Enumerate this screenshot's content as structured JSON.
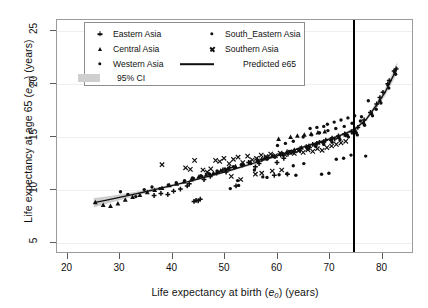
{
  "figure": {
    "background": "#ffffff",
    "panel_border": "#9b9b9b",
    "grid_color": "#efefef"
  },
  "axes": {
    "x": {
      "title_plain": "Life expectancy at birth (e0) (years)",
      "title_prefix": "Life expectancy at birth (",
      "title_var": "e",
      "title_sub": "0",
      "title_suffix": ") (years)",
      "ticks": [
        20,
        30,
        40,
        50,
        60,
        70,
        80
      ],
      "min": 18.0,
      "max": 86.0
    },
    "y": {
      "title_plain": "Life expectancy at age 65 (e65) (years)",
      "title_prefix": "Life expectancy at age 65 (",
      "title_var": "e",
      "title_sub": "65",
      "title_suffix": ") (years)",
      "ticks": [
        5,
        10,
        15,
        20,
        25
      ],
      "min": 4.0,
      "max": 26.0
    }
  },
  "legend": {
    "position": "top-left-inside",
    "border": "#8d8d8d",
    "ci_swatch_color": "#cfcfcf",
    "entries": [
      {
        "label": "Eastern Asia",
        "marker": "plus",
        "col": 0,
        "row": 0
      },
      {
        "label": "Central Asia",
        "marker": "triangle",
        "col": 0,
        "row": 1
      },
      {
        "label": "Western Asia",
        "marker": "dot",
        "col": 0,
        "row": 2
      },
      {
        "label": "95% CI",
        "marker": "band",
        "col": 0,
        "row": 3
      },
      {
        "label": "South_Eastern Asia",
        "marker": "dot",
        "col": 1,
        "row": 0
      },
      {
        "label": "Southern Asia",
        "marker": "x",
        "col": 1,
        "row": 1
      },
      {
        "label": "Predicted e65",
        "marker": "line",
        "col": 1,
        "row": 2
      }
    ]
  },
  "annotations": {
    "vertical_reference_line": {
      "x": 74.5,
      "color": "#000000",
      "width_px": 2
    }
  },
  "chart_data": {
    "type": "scatter",
    "title": "",
    "xlabel": "Life expectancy at birth (e0) (years)",
    "ylabel": "Life expectancy at age 65 (e65) (years)",
    "xlim": [
      18,
      86
    ],
    "ylim": [
      4,
      26
    ],
    "xticks": [
      20,
      30,
      40,
      50,
      60,
      70,
      80
    ],
    "yticks": [
      5,
      10,
      15,
      20,
      25
    ],
    "grid": "horizontal-faint",
    "legend_position": "upper-left-inside",
    "marker_color": "#0f0f0f",
    "fit_line": {
      "name": "Predicted e65",
      "color": "#111111",
      "x": [
        25,
        27,
        29,
        31,
        33,
        35,
        37,
        39,
        41,
        43,
        45,
        47,
        49,
        51,
        53,
        55,
        57,
        59,
        61,
        63,
        65,
        67,
        69,
        71,
        73,
        75,
        77,
        79,
        80.5,
        82,
        82.8
      ],
      "y": [
        8.82,
        9.02,
        9.23,
        9.44,
        9.66,
        9.88,
        10.1,
        10.33,
        10.57,
        10.81,
        11.06,
        11.32,
        11.59,
        11.87,
        12.16,
        12.46,
        12.77,
        13.09,
        13.42,
        13.75,
        14.07,
        14.38,
        14.68,
        14.99,
        15.35,
        15.85,
        16.72,
        18.1,
        19.2,
        20.7,
        21.55
      ]
    },
    "ci_band": {
      "name": "95% CI",
      "color": "#cfcfcf",
      "x": [
        25,
        27,
        29,
        31,
        33,
        35,
        37,
        39,
        41,
        43,
        45,
        47,
        49,
        51,
        53,
        55,
        57,
        59,
        61,
        63,
        65,
        67,
        69,
        71,
        73,
        75,
        77,
        79,
        80.5,
        82,
        82.8
      ],
      "lower": [
        8.38,
        8.66,
        8.94,
        9.2,
        9.46,
        9.71,
        9.96,
        10.2,
        10.45,
        10.7,
        10.95,
        11.21,
        11.48,
        11.76,
        12.05,
        12.35,
        12.66,
        12.98,
        13.31,
        13.64,
        13.96,
        14.27,
        14.57,
        14.87,
        15.22,
        15.7,
        16.52,
        17.82,
        18.85,
        20.25,
        21.05
      ],
      "upper": [
        9.26,
        9.38,
        9.52,
        9.68,
        9.86,
        10.05,
        10.24,
        10.46,
        10.69,
        10.92,
        11.17,
        11.43,
        11.7,
        11.98,
        12.27,
        12.57,
        12.88,
        13.2,
        13.53,
        13.86,
        14.18,
        14.49,
        14.79,
        15.11,
        15.48,
        16.0,
        16.92,
        18.38,
        19.55,
        21.15,
        22.05
      ]
    },
    "series": [
      {
        "name": "Eastern Asia",
        "marker": "plus",
        "points": [
          [
            39.1,
            9.6
          ],
          [
            40.2,
            9.9
          ],
          [
            41.5,
            10.1
          ],
          [
            42.8,
            10.4
          ],
          [
            44.1,
            8.95
          ],
          [
            44.5,
            9.05
          ],
          [
            44.9,
            9.0
          ],
          [
            45.3,
            9.15
          ],
          [
            46.0,
            11.0
          ],
          [
            47.2,
            11.3
          ],
          [
            48.4,
            11.6
          ],
          [
            49.6,
            11.9
          ],
          [
            50.9,
            12.1
          ],
          [
            52.1,
            10.4
          ],
          [
            53.3,
            12.4
          ],
          [
            54.5,
            12.6
          ],
          [
            55.8,
            12.2
          ],
          [
            57.0,
            12.9
          ],
          [
            58.2,
            13.1
          ],
          [
            59.4,
            11.4
          ],
          [
            60.6,
            13.3
          ],
          [
            61.9,
            11.5
          ],
          [
            63.1,
            13.6
          ],
          [
            64.3,
            13.9
          ],
          [
            65.5,
            14.1
          ],
          [
            66.7,
            14.3
          ],
          [
            68.0,
            14.5
          ],
          [
            69.2,
            14.7
          ],
          [
            70.4,
            14.9
          ],
          [
            71.6,
            15.1
          ],
          [
            72.8,
            15.3
          ],
          [
            74.1,
            15.5
          ],
          [
            75.3,
            15.9
          ],
          [
            76.5,
            16.6
          ],
          [
            77.7,
            17.3
          ],
          [
            78.9,
            18.1
          ],
          [
            80.1,
            19.2
          ],
          [
            81.3,
            20.3
          ],
          [
            82.2,
            21.2
          ],
          [
            36.5,
            9.5
          ],
          [
            37.8,
            9.7
          ],
          [
            43.2,
            10.6
          ],
          [
            50.2,
            11.7
          ],
          [
            56.5,
            12.5
          ],
          [
            62.0,
            13.4
          ],
          [
            67.5,
            14.4
          ],
          [
            73.0,
            15.2
          ],
          [
            79.5,
            18.7
          ],
          [
            81.0,
            20.0
          ],
          [
            82.6,
            21.4
          ],
          [
            59.9,
            12.6
          ],
          [
            61.2,
            13.0
          ],
          [
            66.1,
            14.0
          ],
          [
            70.9,
            14.8
          ]
        ]
      },
      {
        "name": "Central Asia",
        "marker": "triangle",
        "points": [
          [
            25.3,
            8.85
          ],
          [
            26.8,
            8.6
          ],
          [
            28.2,
            8.5
          ],
          [
            29.6,
            8.75
          ],
          [
            31.0,
            9.1
          ],
          [
            32.4,
            9.35
          ],
          [
            33.8,
            9.55
          ],
          [
            35.2,
            9.8
          ],
          [
            36.6,
            10.0
          ],
          [
            38.0,
            10.2
          ],
          [
            39.4,
            10.45
          ],
          [
            40.8,
            10.6
          ],
          [
            42.2,
            10.8
          ],
          [
            43.6,
            11.0
          ],
          [
            45.0,
            11.25
          ],
          [
            46.4,
            11.45
          ],
          [
            47.8,
            11.6
          ],
          [
            49.2,
            11.85
          ],
          [
            50.6,
            12.05
          ],
          [
            52.0,
            12.25
          ],
          [
            53.4,
            12.45
          ],
          [
            54.8,
            12.65
          ],
          [
            56.2,
            12.85
          ],
          [
            57.6,
            13.05
          ],
          [
            59.0,
            13.25
          ],
          [
            60.4,
            13.4
          ],
          [
            61.8,
            13.6
          ],
          [
            63.2,
            13.8
          ],
          [
            64.6,
            14.0
          ],
          [
            66.0,
            14.2
          ],
          [
            67.4,
            14.4
          ],
          [
            68.8,
            14.6
          ],
          [
            70.2,
            14.8
          ],
          [
            71.6,
            15.0
          ],
          [
            73.0,
            15.2
          ],
          [
            74.4,
            15.4
          ],
          [
            62.5,
            15.0
          ],
          [
            63.8,
            15.1
          ],
          [
            65.1,
            15.2
          ],
          [
            66.4,
            15.3
          ],
          [
            67.7,
            15.4
          ],
          [
            69.0,
            15.5
          ],
          [
            60.2,
            14.8
          ]
        ]
      },
      {
        "name": "Western Asia",
        "marker": "dot",
        "points": [
          [
            30.1,
            9.85
          ],
          [
            31.5,
            9.6
          ],
          [
            33.0,
            9.4
          ],
          [
            34.6,
            10.05
          ],
          [
            36.1,
            10.3
          ],
          [
            37.6,
            10.15
          ],
          [
            39.2,
            10.5
          ],
          [
            40.7,
            10.7
          ],
          [
            42.3,
            10.9
          ],
          [
            43.8,
            11.15
          ],
          [
            45.4,
            11.35
          ],
          [
            46.9,
            11.55
          ],
          [
            48.5,
            11.8
          ],
          [
            50.0,
            12.0
          ],
          [
            51.6,
            12.2
          ],
          [
            53.1,
            12.4
          ],
          [
            54.7,
            12.6
          ],
          [
            56.2,
            12.8
          ],
          [
            57.8,
            13.0
          ],
          [
            59.3,
            13.2
          ],
          [
            60.9,
            13.45
          ],
          [
            62.4,
            13.65
          ],
          [
            64.0,
            13.85
          ],
          [
            65.5,
            14.05
          ],
          [
            67.1,
            14.25
          ],
          [
            68.6,
            14.5
          ],
          [
            70.2,
            14.7
          ],
          [
            71.7,
            14.95
          ],
          [
            73.3,
            15.2
          ],
          [
            74.8,
            15.6
          ],
          [
            76.4,
            16.3
          ],
          [
            77.9,
            17.2
          ],
          [
            79.5,
            18.4
          ],
          [
            81.0,
            19.9
          ],
          [
            82.3,
            21.1
          ],
          [
            69.5,
            16.2
          ],
          [
            70.8,
            16.4
          ],
          [
            72.1,
            16.6
          ],
          [
            73.4,
            16.8
          ],
          [
            74.7,
            17.0
          ],
          [
            76.0,
            16.9
          ],
          [
            66.2,
            15.8
          ],
          [
            67.5,
            15.9
          ],
          [
            68.8,
            16.0
          ],
          [
            75.2,
            15.2
          ],
          [
            76.8,
            13.2
          ],
          [
            74.0,
            13.3
          ],
          [
            72.6,
            13.0
          ],
          [
            71.2,
            12.9
          ],
          [
            69.8,
            11.6
          ],
          [
            68.4,
            11.5
          ],
          [
            63.5,
            11.4
          ],
          [
            58.0,
            11.2
          ],
          [
            52.4,
            10.9
          ],
          [
            65.0,
            12.5
          ],
          [
            63.0,
            12.3
          ]
        ]
      },
      {
        "name": "South_Eastern Asia",
        "marker": "dot",
        "points": [
          [
            44.0,
            11.1
          ],
          [
            45.6,
            11.3
          ],
          [
            47.1,
            11.5
          ],
          [
            48.7,
            11.7
          ],
          [
            50.2,
            11.9
          ],
          [
            51.8,
            12.1
          ],
          [
            53.3,
            12.3
          ],
          [
            54.9,
            12.5
          ],
          [
            56.4,
            12.7
          ],
          [
            58.0,
            12.9
          ],
          [
            59.5,
            13.1
          ],
          [
            61.1,
            13.3
          ],
          [
            62.6,
            13.5
          ],
          [
            64.2,
            13.7
          ],
          [
            65.7,
            13.9
          ],
          [
            67.3,
            14.1
          ],
          [
            68.8,
            14.3
          ],
          [
            70.4,
            14.5
          ],
          [
            71.9,
            14.75
          ],
          [
            73.5,
            15.0
          ],
          [
            75.0,
            15.4
          ],
          [
            76.6,
            16.1
          ],
          [
            78.1,
            17.0
          ],
          [
            79.7,
            18.2
          ],
          [
            81.2,
            19.6
          ],
          [
            82.5,
            20.9
          ],
          [
            51.0,
            10.15
          ],
          [
            52.6,
            10.45
          ],
          [
            57.2,
            11.25
          ],
          [
            60.3,
            11.45
          ],
          [
            61.8,
            11.55
          ],
          [
            55.6,
            11.9
          ],
          [
            64.9,
            15.0
          ],
          [
            66.5,
            15.2
          ],
          [
            68.0,
            15.4
          ],
          [
            69.6,
            15.6
          ],
          [
            71.1,
            15.8
          ],
          [
            72.7,
            16.0
          ],
          [
            74.2,
            16.3
          ],
          [
            75.8,
            16.5
          ],
          [
            77.3,
            18.4
          ],
          [
            78.8,
            17.6
          ],
          [
            60.0,
            14.2
          ],
          [
            61.5,
            14.4
          ],
          [
            63.0,
            14.6
          ]
        ]
      },
      {
        "name": "Southern Asia",
        "marker": "x",
        "points": [
          [
            38.0,
            12.4
          ],
          [
            44.2,
            12.8
          ],
          [
            45.8,
            11.9
          ],
          [
            47.3,
            12.0
          ],
          [
            48.2,
            12.8
          ],
          [
            49.0,
            12.7
          ],
          [
            49.8,
            13.0
          ],
          [
            50.8,
            12.5
          ],
          [
            51.6,
            12.9
          ],
          [
            52.5,
            13.1
          ],
          [
            53.4,
            12.6
          ],
          [
            54.3,
            13.2
          ],
          [
            55.2,
            12.85
          ],
          [
            56.0,
            13.0
          ],
          [
            56.9,
            13.3
          ],
          [
            57.8,
            13.15
          ],
          [
            58.7,
            13.4
          ],
          [
            59.6,
            13.25
          ],
          [
            60.5,
            13.5
          ],
          [
            61.4,
            13.35
          ],
          [
            62.3,
            13.6
          ],
          [
            63.2,
            13.45
          ],
          [
            64.0,
            13.7
          ],
          [
            64.9,
            13.55
          ],
          [
            65.8,
            13.8
          ],
          [
            66.7,
            13.65
          ],
          [
            67.6,
            13.9
          ],
          [
            68.5,
            13.75
          ],
          [
            42.5,
            12.1
          ],
          [
            43.4,
            11.95
          ],
          [
            46.6,
            11.7
          ],
          [
            51.2,
            11.3
          ],
          [
            53.0,
            11.0
          ],
          [
            59.0,
            11.8
          ],
          [
            60.8,
            11.9
          ],
          [
            69.4,
            14.0
          ],
          [
            70.3,
            14.15
          ],
          [
            71.2,
            14.3
          ],
          [
            72.1,
            14.45
          ],
          [
            73.0,
            14.6
          ],
          [
            55.8,
            11.5
          ],
          [
            57.0,
            11.6
          ]
        ]
      }
    ]
  }
}
